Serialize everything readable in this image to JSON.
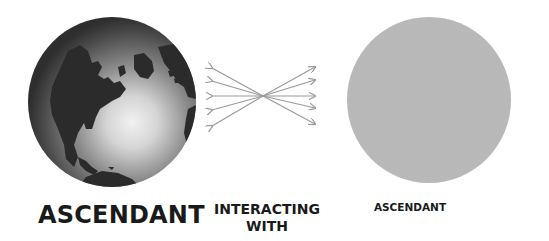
{
  "diagram": {
    "left_node": {
      "label": "ASCENDANT",
      "image": "globe-earth-north-america"
    },
    "connector": {
      "label_line1": "INTERACTING",
      "label_line2": "WITH",
      "icon": "crossing-bidirectional-arrows",
      "arrow_count": 5,
      "color": "#9a9a9a"
    },
    "right_node": {
      "label": "ASCENDANT",
      "image": "stippled-gray-disc",
      "color": "#cfcfcf"
    }
  }
}
